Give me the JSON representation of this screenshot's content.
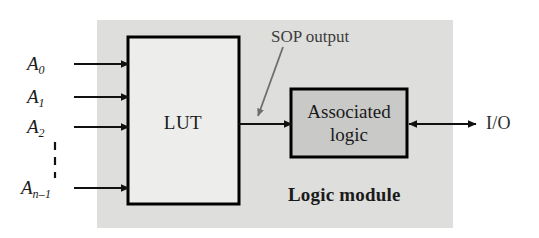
{
  "figure": {
    "module": {
      "label": "Logic module",
      "background_color": "#dededc"
    },
    "blocks": [
      {
        "id": "lut",
        "label": "LUT",
        "fill_color": "#ededeb",
        "border_color": "#000000"
      },
      {
        "id": "associated_logic",
        "label_line1": "Associated",
        "label_line2": "logic",
        "fill_color": "#c9c9c7",
        "border_color": "#000000"
      }
    ],
    "inputs": [
      {
        "name": "A0",
        "base": "A",
        "subscript": "0"
      },
      {
        "name": "A1",
        "base": "A",
        "subscript": "1"
      },
      {
        "name": "A2",
        "base": "A",
        "subscript": "2"
      },
      {
        "name": "An_minus_1",
        "base": "A",
        "subscript": "n–1"
      }
    ],
    "vertical_ellipsis": "dashed-line",
    "annotations": [
      {
        "id": "sop_output",
        "label": "SOP output",
        "color": "#3d3d3d",
        "pointer": "diagonal-arrow-down-left"
      }
    ],
    "ports": [
      {
        "id": "io",
        "label": "I/O",
        "arrow": "bidirectional"
      }
    ],
    "connections": [
      {
        "from": "lut",
        "to": "associated_logic",
        "arrow": "unidirectional"
      }
    ]
  }
}
